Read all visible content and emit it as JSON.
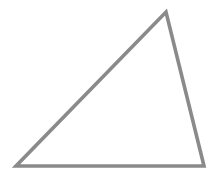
{
  "canvas": {
    "width": 217,
    "height": 173,
    "background_color": "#ffffff",
    "label": "triangle-drawing-canvas"
  },
  "figure": {
    "name": "triangle",
    "shape_type": "triangle",
    "classification": "scalene obtuse triangle",
    "fill": "none",
    "fill_color": "#ffffff",
    "stroke_color": "#8a8a8a",
    "stroke_width": 3.6,
    "stroke_linejoin": "miter",
    "stroke_linecap": "butt",
    "vertices": [
      {
        "name": "bottom-left-vertex",
        "x": 16,
        "y": 166
      },
      {
        "name": "bottom-right-vertex",
        "x": 204,
        "y": 166
      },
      {
        "name": "apex-vertex",
        "x": 166,
        "y": 12
      }
    ],
    "points_attr": "16,166 204,166 166,12",
    "edges": [
      {
        "name": "base-edge",
        "from": "bottom-left-vertex",
        "to": "bottom-right-vertex"
      },
      {
        "name": "right-edge",
        "from": "bottom-right-vertex",
        "to": "apex-vertex"
      },
      {
        "name": "hypotenuse-edge",
        "from": "apex-vertex",
        "to": "bottom-left-vertex"
      }
    ]
  }
}
